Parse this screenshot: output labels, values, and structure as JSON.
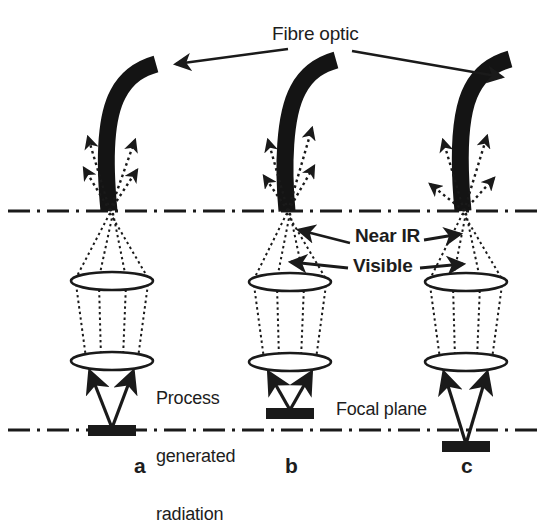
{
  "figure": {
    "kind": "optical-diagram",
    "colors": {
      "ink": "#1a1a1a",
      "fibre": "#141414",
      "lens_fill": "#ffffff",
      "source": "#1a1a1a"
    }
  },
  "labels": {
    "fibre_optic": "Fibre optic",
    "near_ir": "Near IR",
    "visible": "Visible",
    "process_line1": "Process",
    "process_line2": "generated",
    "process_line3": "radiation",
    "focal_plane": "Focal plane",
    "panel_a": "a",
    "panel_b": "b",
    "panel_c": "c"
  },
  "panels": [
    {
      "id": "a",
      "label": "a",
      "axis_x": 112,
      "source_offset": "on-focal-plane",
      "source_y": 430,
      "fibre_tip_x": 110,
      "fibre_bend": "right",
      "emission_arrows": 4,
      "lens_count": 2
    },
    {
      "id": "b",
      "label": "b",
      "axis_x": 290,
      "source_offset": "above-focal-plane",
      "source_y": 412,
      "fibre_tip_x": 287,
      "fibre_bend": "right",
      "emission_arrows": 4,
      "lens_count": 2
    },
    {
      "id": "c",
      "label": "c",
      "axis_x": 466,
      "source_offset": "below-focal-plane",
      "source_y": 446,
      "fibre_tip_x": 464,
      "fibre_bend": "right",
      "emission_arrows": 4,
      "lens_count": 2
    }
  ],
  "reference_lines": [
    {
      "name": "fibre-tip-plane",
      "y": 211,
      "style": "dash-dot"
    },
    {
      "name": "focal-plane",
      "y": 430,
      "style": "dash-dot"
    }
  ]
}
